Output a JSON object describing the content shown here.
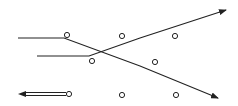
{
  "diagram": {
    "title": "",
    "stroke_color": "#222222",
    "background": "#ffffff",
    "paths": [
      {
        "id": "upper-track",
        "points": [
          [
            18,
            38
          ],
          [
            64,
            38
          ],
          [
            140,
            66
          ],
          [
            218,
            98
          ]
        ],
        "arrow_end": true
      },
      {
        "id": "lower-track",
        "points": [
          [
            37,
            56
          ],
          [
            89,
            56
          ],
          [
            140,
            38
          ],
          [
            226,
            10
          ]
        ],
        "arrow_end": true
      }
    ],
    "double_arrow": {
      "from": [
        66,
        94
      ],
      "to": [
        18,
        94
      ],
      "gap": 3
    },
    "nodes": [
      {
        "id": "n1",
        "cx": 67,
        "cy": 35,
        "r": 2.6
      },
      {
        "id": "n2",
        "cx": 92,
        "cy": 61,
        "r": 2.6
      },
      {
        "id": "n3",
        "cx": 122,
        "cy": 36,
        "r": 2.6
      },
      {
        "id": "n4",
        "cx": 175,
        "cy": 36,
        "r": 2.6
      },
      {
        "id": "n5",
        "cx": 155,
        "cy": 62,
        "r": 2.6
      },
      {
        "id": "n6",
        "cx": 69,
        "cy": 94,
        "r": 2.6
      },
      {
        "id": "n7",
        "cx": 122,
        "cy": 95,
        "r": 2.6
      },
      {
        "id": "n8",
        "cx": 176,
        "cy": 95,
        "r": 2.6
      }
    ]
  }
}
